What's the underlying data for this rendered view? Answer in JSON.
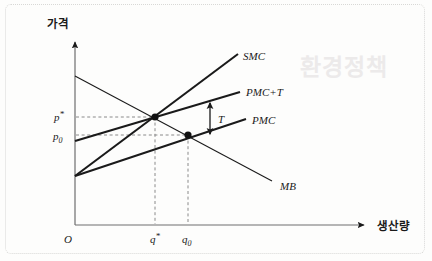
{
  "figure": {
    "kind": "economics-line-diagram",
    "background_color": "#fdfdfc",
    "line_color": "#1a1a1a",
    "guide_color": "#7d7d7d",
    "border_color": "#d8d8d6",
    "ghost_watermark": "환경정책"
  },
  "axes": {
    "y_title": "가격",
    "x_title": "생산량",
    "origin_label": "O"
  },
  "ticks": {
    "y": [
      {
        "name": "p_star",
        "label_main": "p",
        "label_sup": "*",
        "value_y": 117
      },
      {
        "name": "p_zero",
        "label_main": "p",
        "label_sub": "0",
        "value_y": 135
      }
    ],
    "x": [
      {
        "name": "q_star",
        "label_main": "q",
        "label_sup": "*",
        "value_x": 155
      },
      {
        "name": "q_zero",
        "label_main": "q",
        "label_sub": "0",
        "value_x": 188
      }
    ]
  },
  "curves": [
    {
      "id": "smc",
      "label": "SMC",
      "label_x": 243,
      "label_y": 60,
      "x1": 75,
      "y1": 176,
      "x2": 238,
      "y2": 54,
      "width": 2.1
    },
    {
      "id": "pmc_plus_t",
      "label": "PMC+T",
      "label_x": 246,
      "label_y": 96,
      "x1": 75,
      "y1": 141,
      "x2": 240,
      "y2": 92,
      "width": 2.1
    },
    {
      "id": "pmc",
      "label": "PMC",
      "label_x": 252,
      "label_y": 124,
      "x1": 75,
      "y1": 176,
      "x2": 246,
      "y2": 119,
      "width": 2.1
    },
    {
      "id": "mb",
      "label": "MB",
      "label_x": 280,
      "label_y": 190,
      "x1": 75,
      "y1": 76,
      "x2": 272,
      "y2": 181,
      "width": 1.0
    }
  ],
  "points": [
    {
      "id": "equilibrium-with-tax",
      "x": 155,
      "y": 117,
      "r": 3.6
    },
    {
      "id": "equilibrium-no-tax",
      "x": 188,
      "y": 135,
      "r": 3.6
    }
  ],
  "annotations": {
    "tax_gap": {
      "label": "T",
      "arrow_x": 210,
      "arrow_top_y": 104,
      "arrow_bottom_y": 133,
      "label_x": 219,
      "label_y": 122
    }
  },
  "geometry": {
    "y_axis_x": 75,
    "y_axis_top": 38,
    "x_axis_y": 225,
    "x_axis_right": 368
  }
}
